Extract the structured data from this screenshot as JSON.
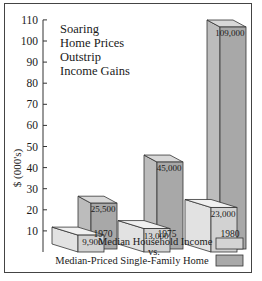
{
  "chart_data": {
    "type": "bar",
    "title": "Soaring Home Prices Outstrip Income Gains",
    "title_lines": [
      "Soaring",
      "Home Prices",
      "Outstrip",
      "Income Gains"
    ],
    "xlabel": "",
    "ylabel": "$ (000's)",
    "ylim": [
      0,
      110
    ],
    "yticks": [
      10,
      20,
      30,
      40,
      50,
      60,
      70,
      80,
      90,
      100,
      110
    ],
    "categories": [
      "1970",
      "1975",
      "1980"
    ],
    "series": [
      {
        "name": "Median Household Income",
        "values": [
          9900,
          13000,
          23000
        ],
        "labels": [
          "9,900",
          "13,000",
          "23,000"
        ],
        "color": "#d4d4d4"
      },
      {
        "name": "Median-Priced Single-Family Home",
        "values": [
          25500,
          45000,
          109000
        ],
        "labels": [
          "25,500",
          "45,000",
          "109,000"
        ],
        "color": "#a9a9a9"
      }
    ],
    "style": "3d-bar",
    "grid": false,
    "legend": {
      "position": "bottom-right",
      "line1": "Median Household Income",
      "line2": "vs.",
      "line3": "Median-Priced Single-Family Home"
    }
  }
}
